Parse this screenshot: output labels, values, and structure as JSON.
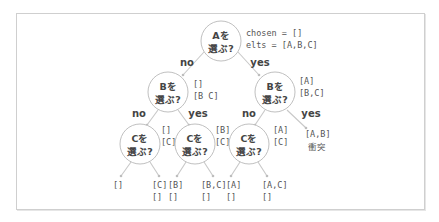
{
  "root": {
    "label_line1": "Aを",
    "label_line2": "選ぶ?",
    "state_line1": "chosen = []",
    "state_line2": "elts = [A,B,C]"
  },
  "edges": {
    "no": "no",
    "yes": "yes"
  },
  "level1": [
    {
      "label_line1": "Bを",
      "label_line2": "選ぶ?",
      "state_line1": "[]",
      "state_line2": "[B C]"
    },
    {
      "label_line1": "Bを",
      "label_line2": "選ぶ?",
      "state_line1": "[A]",
      "state_line2": "[B,C]"
    }
  ],
  "level2": [
    {
      "label_line1": "Cを",
      "label_line2": "選ぶ?",
      "state_line1": "[]",
      "state_line2": "[C]"
    },
    {
      "label_line1": "Cを",
      "label_line2": "選ぶ?",
      "state_line1": "[B]",
      "state_line2": "[C]"
    },
    {
      "label_line1": "Cを",
      "label_line2": "選ぶ?",
      "state_line1": "[A]",
      "state_line2": "[C]"
    }
  ],
  "pruned": {
    "state": "[A,B]",
    "note": "衝突"
  },
  "leaves": [
    {
      "line1": "[]",
      "line2": ""
    },
    {
      "line1": "[C]",
      "line2": "[]"
    },
    {
      "line1": "[B]",
      "line2": "[]"
    },
    {
      "line1": "[B,C]",
      "line2": "[]"
    },
    {
      "line1": "[A]",
      "line2": "[]"
    },
    {
      "line1": "[A,C]",
      "line2": "[]"
    }
  ],
  "colors": {
    "line": "#c8c8c8",
    "text": "#444444",
    "circle_stroke": "#c0c0c0"
  }
}
